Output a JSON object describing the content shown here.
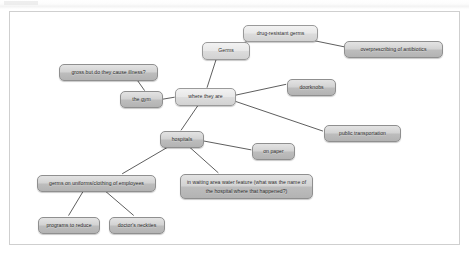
{
  "document": {
    "type": "mind-map",
    "title": "Germs mind map",
    "canvas_background": "#ffffff",
    "border_color": "#cfcfcf",
    "node_fill": "#d2d2d2",
    "node_border": "#8f8f8f",
    "edge_color": "#4a4a4a",
    "text_color": "#2b2b2b"
  },
  "nodes": [
    {
      "id": "germs",
      "label": "Germs",
      "x": 192,
      "y": 30,
      "w": 48,
      "h": 18,
      "style": "light"
    },
    {
      "id": "drug_resistant",
      "label": "drug-resistant germs",
      "x": 233,
      "y": 13,
      "w": 75,
      "h": 17,
      "style": "light"
    },
    {
      "id": "overprescribing",
      "label": "overprescribing of antibiotics",
      "x": 334,
      "y": 29,
      "w": 99,
      "h": 17,
      "style": "normal"
    },
    {
      "id": "gross_illness",
      "label": "gross but do they cause illness?",
      "x": 49,
      "y": 52,
      "w": 99,
      "h": 17,
      "style": "normal"
    },
    {
      "id": "the_gym",
      "label": "the gym",
      "x": 110,
      "y": 79,
      "w": 43,
      "h": 17,
      "style": "normal"
    },
    {
      "id": "where_they_are",
      "label": "where they are",
      "x": 165,
      "y": 76,
      "w": 61,
      "h": 18,
      "style": "light"
    },
    {
      "id": "doorknobs",
      "label": "doorknobs",
      "x": 277,
      "y": 67,
      "w": 49,
      "h": 17,
      "style": "normal"
    },
    {
      "id": "public_transport",
      "label": "public transportation",
      "x": 314,
      "y": 113,
      "w": 77,
      "h": 17,
      "style": "normal"
    },
    {
      "id": "hospitals",
      "label": "hospitals",
      "x": 150,
      "y": 119,
      "w": 44,
      "h": 17,
      "style": "normal"
    },
    {
      "id": "on_paper",
      "label": "on paper",
      "x": 242,
      "y": 131,
      "w": 43,
      "h": 17,
      "style": "normal"
    },
    {
      "id": "uniforms",
      "label": "germs on uniforms/clothing of employees",
      "x": 27,
      "y": 163,
      "w": 119,
      "h": 17,
      "style": "normal"
    },
    {
      "id": "water_feature",
      "label": "in waiting area water feature (what was the name of the hospital where that happened?)",
      "x": 170,
      "y": 162,
      "w": 133,
      "h": 25,
      "style": "normal"
    },
    {
      "id": "programs",
      "label": "programs to reduce",
      "x": 28,
      "y": 205,
      "w": 62,
      "h": 17,
      "style": "normal"
    },
    {
      "id": "neckties",
      "label": "doctor's neckties",
      "x": 99,
      "y": 205,
      "w": 56,
      "h": 17,
      "style": "normal"
    }
  ],
  "edges": [
    {
      "from": "germs",
      "to": "drug_resistant",
      "x1": 231,
      "y1": 36,
      "x2": 239,
      "y2": 28
    },
    {
      "from": "drug_resistant",
      "to": "overprescribing",
      "x1": 301,
      "y1": 28,
      "x2": 340,
      "y2": 36
    },
    {
      "from": "germs",
      "to": "where_they_are",
      "x1": 207,
      "y1": 48,
      "x2": 198,
      "y2": 76
    },
    {
      "from": "gross_illness",
      "to": "the_gym",
      "x1": 128,
      "y1": 69,
      "x2": 135,
      "y2": 79
    },
    {
      "from": "the_gym",
      "to": "where_they_are",
      "x1": 153,
      "y1": 88,
      "x2": 165,
      "y2": 86
    },
    {
      "from": "where_they_are",
      "to": "doorknobs",
      "x1": 226,
      "y1": 84,
      "x2": 277,
      "y2": 73
    },
    {
      "from": "where_they_are",
      "to": "public_transport",
      "x1": 226,
      "y1": 90,
      "x2": 314,
      "y2": 120
    },
    {
      "from": "where_they_are",
      "to": "hospitals",
      "x1": 189,
      "y1": 94,
      "x2": 172,
      "y2": 119
    },
    {
      "from": "hospitals",
      "to": "on_paper",
      "x1": 194,
      "y1": 130,
      "x2": 242,
      "y2": 139
    },
    {
      "from": "hospitals",
      "to": "uniforms",
      "x1": 159,
      "y1": 136,
      "x2": 113,
      "y2": 163
    },
    {
      "from": "hospitals",
      "to": "water_feature",
      "x1": 180,
      "y1": 136,
      "x2": 209,
      "y2": 162
    },
    {
      "from": "uniforms",
      "to": "programs",
      "x1": 74,
      "y1": 180,
      "x2": 59,
      "y2": 205
    },
    {
      "from": "uniforms",
      "to": "neckties",
      "x1": 95,
      "y1": 180,
      "x2": 124,
      "y2": 205
    }
  ]
}
